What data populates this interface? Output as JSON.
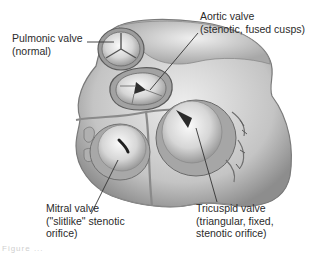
{
  "figure": {
    "labels": {
      "pulmonic": {
        "line1": "Pulmonic valve",
        "line2": "(normal)"
      },
      "aortic": {
        "line1": "Aortic valve",
        "line2": "(stenotic, fused cusps)"
      },
      "mitral": {
        "line1": "Mitral valve",
        "line2": "(\"slitlike\" stenotic",
        "line3": "orifice)"
      },
      "tricuspid": {
        "line1": "Tricuspid valve",
        "line2": "(triangular, fixed,",
        "line3": "stenotic orifice)"
      }
    },
    "caption_fragment": "Figure ..."
  },
  "colors": {
    "background": "#ffffff",
    "tissue_light": "#e6e6e6",
    "tissue_mid": "#b5b5b5",
    "tissue_dark": "#6e6e6e",
    "text": "#2b2b2b"
  }
}
